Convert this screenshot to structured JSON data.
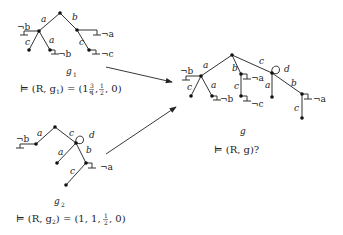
{
  "graphs": {
    "g1": {
      "name": "g",
      "subscript": "1",
      "caption_prefix": "⊨ (R, g",
      "caption_mid": ") = (1, ",
      "caption_values": [
        "1",
        "3/4",
        "1/2",
        "0"
      ],
      "caption_text": "⊨ (R, g1) = (1, 3/4, 1/2, 0)",
      "edge_labels": {
        "left": "a",
        "right": "b",
        "left_c": "c",
        "left_a": "a",
        "right_c": "c"
      },
      "negations": {
        "not_b_left": "¬b",
        "not_b_leaf": "¬b",
        "not_a": "¬a",
        "not_c": "¬c"
      }
    },
    "g2": {
      "name": "g",
      "subscript": "2",
      "caption_text": "⊨ (R, g2) = (1, 1, 1/2, 0)",
      "caption_values": [
        "1",
        "1",
        "1/2",
        "0"
      ],
      "edge_labels": {
        "left": "a",
        "right": "c",
        "loop": "d",
        "mid_a": "a",
        "mid_b": "b",
        "leaf_c": "c"
      },
      "negations": {
        "not_b": "¬b",
        "not_a": "¬a"
      }
    },
    "g": {
      "name": "g",
      "caption_text": "⊨ (R, g)?",
      "edge_labels": {
        "a": "a",
        "b": "b",
        "c": "c",
        "loop": "d",
        "a_c": "c",
        "a_a": "a",
        "b_c": "c",
        "c_a": "a",
        "c_b": "b",
        "cb_c": "c"
      },
      "negations": {
        "not_b_left": "¬b",
        "not_b_leaf": "¬b",
        "not_a_b": "¬a",
        "not_c": "¬c",
        "not_a_cb": "¬a"
      }
    }
  },
  "labels": {
    "a": "a",
    "b": "b",
    "c": "c",
    "d": "d",
    "nb": "¬b",
    "na": "¬a",
    "nc": "¬c",
    "g1_cap_1": "⊨ (R, g",
    "g1_cap_sub": "1",
    "g1_cap_2": ") = (1, ",
    "g1_frac1_num": "3",
    "g1_frac1_den": "4",
    "g1_frac2_num": "1",
    "g1_frac2_den": "2",
    "g1_cap_3": ", 0)",
    "g2_cap_1": "⊨ (R, g",
    "g2_cap_sub": "2",
    "g2_cap_2": ") = (1, 1, ",
    "g2_frac_num": "1",
    "g2_frac_den": "2",
    "g2_cap_3": ", 0)",
    "g_cap": "⊨ (R, g)?",
    "g_name": "g",
    "sep": ", "
  }
}
